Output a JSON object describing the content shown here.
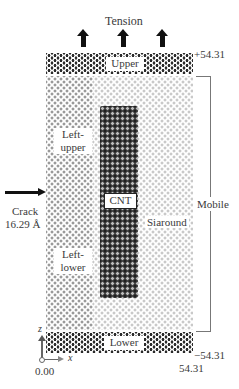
{
  "diagram": {
    "title_force": "Tension",
    "regions": {
      "upper": "Upper",
      "lower": "Lower",
      "left_upper": [
        "Left-",
        "upper"
      ],
      "left_lower": [
        "Left-",
        "lower"
      ],
      "cnt": "CNT",
      "siaround": "Siaround"
    },
    "side_labels": {
      "mobile": "Mobile",
      "crack_line1": "Crack",
      "crack_line2": "16.29 Å"
    },
    "coordinates": {
      "z_top": "+54.31",
      "z_bottom": "−54.31",
      "x_max": "54.31",
      "origin": "0.00"
    },
    "axes": {
      "z_label": "z",
      "x_label": "x"
    },
    "arrows": {
      "tension_count": 3,
      "crack_arrow_direction": "right"
    },
    "colors": {
      "boundary_atoms": "#2b2b2b",
      "left_atoms": "#9a9a9a",
      "right_atoms": "#c9c9c9",
      "cnt_atoms": "#1e1e1e",
      "arrows": "#111111"
    }
  }
}
